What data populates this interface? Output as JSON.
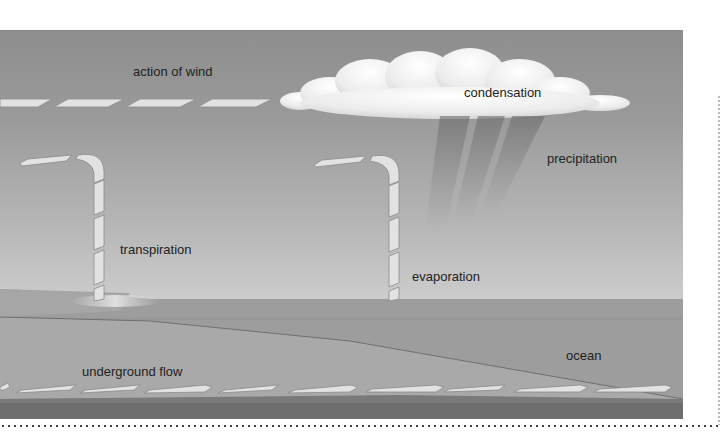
{
  "diagram": {
    "labels": {
      "wind": "action of wind",
      "condensation": "condensation",
      "precipitation": "precipitation",
      "transpiration": "transpiration",
      "evaporation": "evaporation",
      "underground": "underground flow",
      "ocean": "ocean"
    },
    "colors": {
      "sky_top": "#8e8e8e",
      "sky_bottom": "#d2d2d2",
      "ocean": "#9c9c9c",
      "ground": "#a8a8a8",
      "bedrock": "#6e6e6e",
      "arrow_fill": "#e4e4e4",
      "cloud": "#f4f4f4"
    }
  }
}
